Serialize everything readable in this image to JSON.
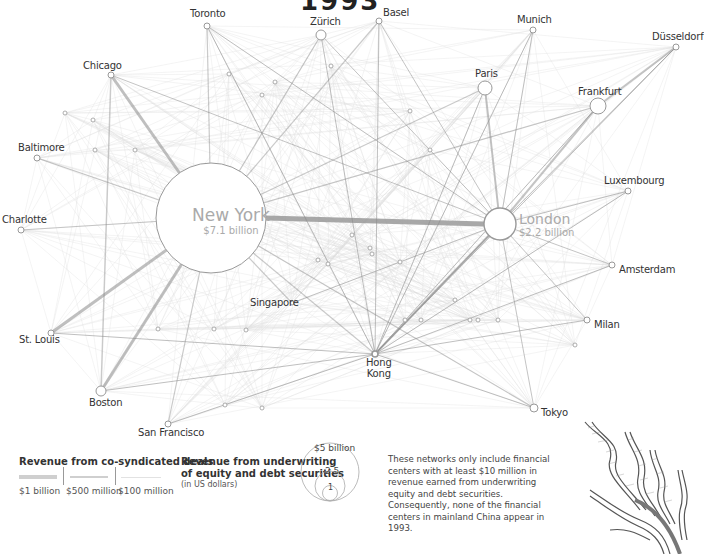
{
  "title": "1993",
  "hubs": {
    "new_york": {
      "name": "New York",
      "value": "$7.1 billion"
    },
    "london": {
      "name": "London",
      "value": "$2.2 billion"
    }
  },
  "cities": [
    {
      "name": "Toronto",
      "x": 207,
      "y": 26,
      "r": 3
    },
    {
      "name": "Zürich",
      "x": 321,
      "y": 35,
      "r": 5
    },
    {
      "name": "Basel",
      "x": 379,
      "y": 21,
      "r": 3
    },
    {
      "name": "Munich",
      "x": 533,
      "y": 30,
      "r": 3
    },
    {
      "name": "Düsseldorf",
      "x": 676,
      "y": 47,
      "r": 3
    },
    {
      "name": "Chicago",
      "x": 111,
      "y": 75,
      "r": 3
    },
    {
      "name": "Paris",
      "x": 485,
      "y": 88,
      "r": 7
    },
    {
      "name": "Frankfurt",
      "x": 598,
      "y": 106,
      "r": 8
    },
    {
      "name": "Baltimore",
      "x": 37,
      "y": 158,
      "r": 3
    },
    {
      "name": "Luxembourg",
      "x": 628,
      "y": 191,
      "r": 3
    },
    {
      "name": "Charlotte",
      "x": 21,
      "y": 230,
      "r": 3
    },
    {
      "name": "Amsterdam",
      "x": 612,
      "y": 265,
      "r": 3
    },
    {
      "name": "Singapore",
      "x": 292,
      "y": 303,
      "r": 2
    },
    {
      "name": "Milan",
      "x": 587,
      "y": 320,
      "r": 3
    },
    {
      "name": "St. Louis",
      "x": 51,
      "y": 333,
      "r": 3
    },
    {
      "name": "Hong Kong",
      "x": 375,
      "y": 354,
      "r": 3
    },
    {
      "name": "Boston",
      "x": 101,
      "y": 391,
      "r": 5
    },
    {
      "name": "Tokyo",
      "x": 534,
      "y": 408,
      "r": 4
    },
    {
      "name": "San Francisco",
      "x": 168,
      "y": 424,
      "r": 3
    }
  ],
  "legend": {
    "cosyndicated_title": "Revenue from co-syndicated deals",
    "line_labels": [
      "$1 billion",
      "$500 million",
      "$100 million"
    ],
    "underwriting_title_1": "Revenue from underwriting",
    "underwriting_title_2": "of equity and debt securities",
    "underwriting_sub": "(in US dollars)",
    "circle_labels": [
      "$5 billion",
      "2.5",
      "1"
    ]
  },
  "note": "These networks only include financial centers with at least $10 million in revenue earned from underwriting equity and debt securities. Consequently, none of the financial centers in mainland China appear in 1993.",
  "colors": {
    "edge_strong": "#8a8a8a",
    "edge_light": "#dcdcdc",
    "node_stroke": "#999999",
    "hub_label": "#aaaaaa"
  }
}
